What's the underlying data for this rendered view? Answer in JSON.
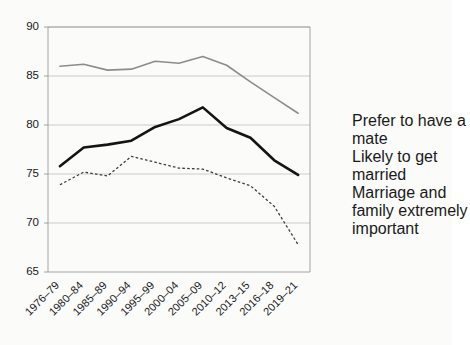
{
  "chart_data": {
    "type": "line",
    "title": "",
    "subtitle": "",
    "xlabel": "",
    "ylabel": "",
    "ylim": [
      65,
      90
    ],
    "ytick_values": [
      65,
      70,
      75,
      80,
      85,
      90
    ],
    "ytick_labels": [
      "65",
      "70",
      "75",
      "80",
      "85",
      "90"
    ],
    "grid": true,
    "grid_axis": "y",
    "legend_position": "right",
    "categories": [
      "1976–79",
      "1980–84",
      "1985–89",
      "1990–94",
      "1995–99",
      "2000–04",
      "2005–09",
      "2010–12",
      "2013–15",
      "2016–18",
      "2019–21"
    ],
    "series": [
      {
        "name": "Prefer to have a mate",
        "style": "solid",
        "color": "#8c8c8c",
        "width": 1.6,
        "values": [
          86.0,
          86.2,
          85.6,
          85.7,
          86.5,
          86.3,
          87.0,
          86.1,
          84.4,
          82.8,
          81.2
        ]
      },
      {
        "name": "Likely to get married",
        "style": "solid",
        "color": "#141414",
        "width": 2.6,
        "values": [
          75.8,
          77.7,
          78.0,
          78.4,
          79.8,
          80.6,
          81.8,
          79.7,
          78.7,
          76.4,
          74.9
        ]
      },
      {
        "name": "Marriage and family extremely important",
        "style": "dotted",
        "color": "#3d3d3d",
        "width": 1.3,
        "values": [
          73.9,
          75.2,
          74.8,
          76.8,
          76.2,
          75.6,
          75.5,
          74.6,
          73.8,
          71.7,
          67.8
        ]
      }
    ]
  },
  "legend": {
    "items": [
      {
        "label": "Prefer to have a\nmate",
        "style": "solid-thin",
        "color": "#8c8c8c"
      },
      {
        "label": "Likely to get\nmarried",
        "style": "solid-thick",
        "color": "#141414"
      },
      {
        "label": "Marriage and\nfamily extremely\nimportant",
        "style": "dotted",
        "color": "#3d3d3d"
      }
    ]
  },
  "axes": {
    "y_min_label": "65",
    "y_max_label": "90"
  }
}
